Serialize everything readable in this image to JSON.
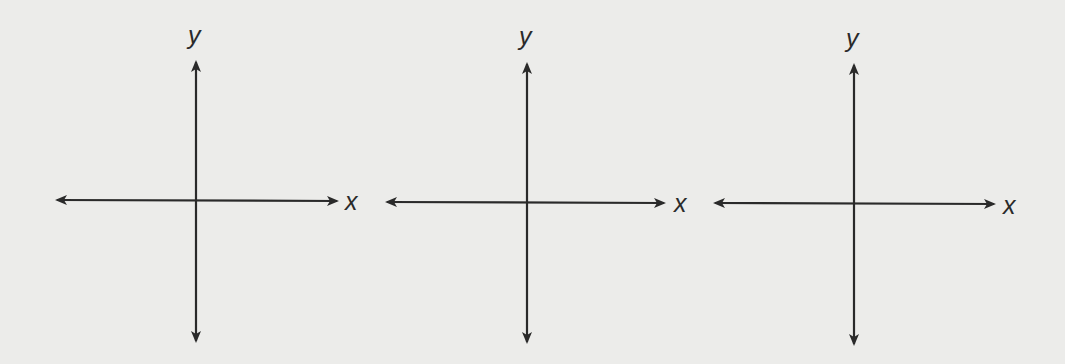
{
  "figure": {
    "panels": [
      {
        "x_label": "x",
        "y_label": "y"
      },
      {
        "x_label": "x",
        "y_label": "y"
      },
      {
        "x_label": "x",
        "y_label": "y"
      }
    ]
  }
}
